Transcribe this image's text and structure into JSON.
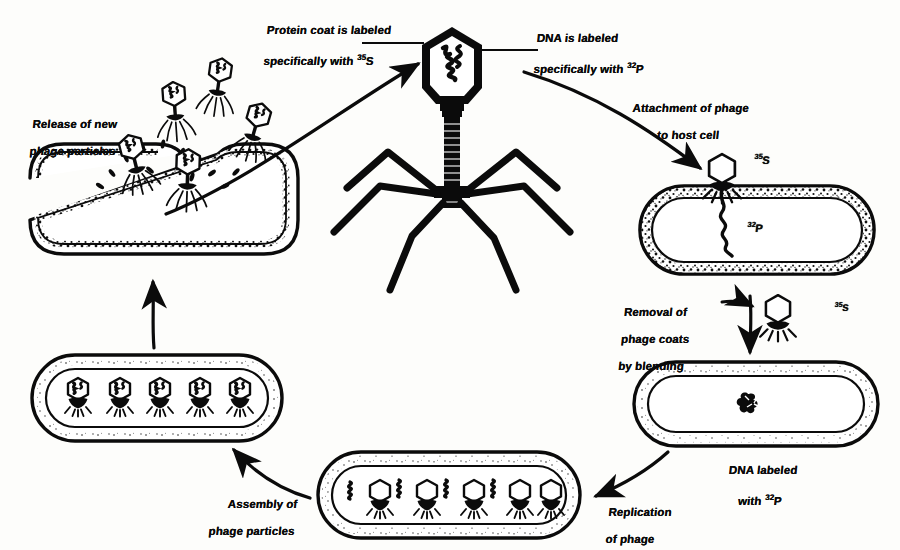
{
  "figure": {
    "ink_color": "#0b0b0b",
    "background_color": "#fdfdfb"
  },
  "labels": {
    "protein_coat": {
      "line1": "Protein coat is labeled",
      "line2": "specifically with ",
      "sup": "35",
      "tail": "S"
    },
    "dna_labeled": {
      "line1": "DNA is labeled",
      "line2": "specifically with ",
      "sup": "32",
      "tail": "P"
    },
    "attachment": {
      "line1": "Attachment of phage",
      "line2": "to host cell"
    },
    "removal": {
      "line1": "Removal of",
      "line2": "phage coats",
      "line3": "by blending"
    },
    "dna_labeled_with": {
      "line1": "DNA labeled",
      "line2": "with ",
      "sup": "32",
      "tail": "P"
    },
    "replication": {
      "line1": "Replication",
      "line2": "of phage"
    },
    "assembly": {
      "line1": "Assembly of",
      "line2": "phage particles"
    },
    "release": {
      "line1": "Release of new",
      "line2": "phage particles"
    }
  },
  "isotopes": {
    "s35_attached": {
      "sup": "35",
      "text": "S"
    },
    "p32_injected": {
      "sup": "32",
      "text": "P"
    },
    "s35_ghost": {
      "sup": "35",
      "text": "S"
    }
  },
  "stages": [
    {
      "id": "free-phage",
      "name": "Free labeled bacteriophage",
      "phage_count": 1,
      "position": "top-center"
    },
    {
      "id": "attachment-cell",
      "name": "Phage attached to host bacterium",
      "phage_count": 1,
      "position": "right"
    },
    {
      "id": "blended-cell",
      "name": "Bacterium with 32P DNA after blending",
      "phage_count": 0,
      "position": "bottom-right"
    },
    {
      "id": "replication-cell",
      "name": "Bacterium replicating phage",
      "phage_count": 5,
      "position": "bottom-center"
    },
    {
      "id": "assembly-cell",
      "name": "Bacterium with assembled phage",
      "phage_count": 5,
      "position": "left"
    },
    {
      "id": "lysis-cell",
      "name": "Lysed bacterium releasing phage",
      "phage_count": 5,
      "position": "top-left"
    }
  ],
  "arrows": [
    {
      "from": "lysis-cell",
      "to": "free-phage",
      "style": "curved"
    },
    {
      "from": "free-phage",
      "to": "attachment-cell",
      "style": "curved"
    },
    {
      "from": "attachment-cell",
      "to": "blended-cell",
      "style": "straight-down"
    },
    {
      "from": "attachment-cell",
      "to": "phage-ghost",
      "style": "short-right"
    },
    {
      "from": "blended-cell",
      "to": "replication-cell",
      "style": "curved"
    },
    {
      "from": "replication-cell",
      "to": "assembly-cell",
      "style": "curved"
    },
    {
      "from": "assembly-cell",
      "to": "lysis-cell",
      "style": "straight-up"
    }
  ]
}
